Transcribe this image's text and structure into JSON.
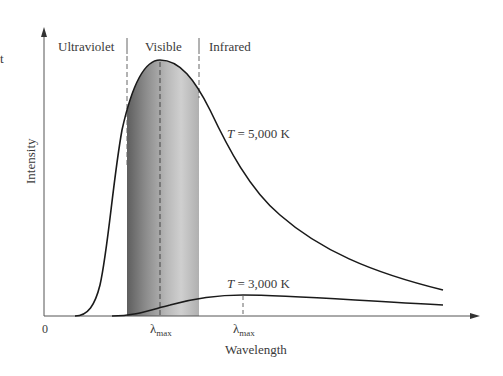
{
  "diagram": {
    "regions": [
      {
        "label": "Ultraviolet"
      },
      {
        "label": "Visible"
      },
      {
        "label": "Infrared"
      }
    ],
    "axes": {
      "x_label": "Wavelength",
      "y_label": "Intensity",
      "origin_label": "0"
    },
    "curves": [
      {
        "temperature_label": "T = 5,000 K",
        "T_italic": "T",
        "rest": " = 5,000 K",
        "lambda_max_label": "λ",
        "lambda_sub": "max"
      },
      {
        "temperature_label": "T = 3,000 K",
        "T_italic": "T",
        "rest": " = 3,000 K",
        "lambda_max_label": "λ",
        "lambda_sub": "max"
      }
    ],
    "edge_fragment": "t",
    "colors": {
      "curve": "#1a1a1a",
      "axis": "#555555",
      "visible_band_dark": "#6e6e6e",
      "visible_band_light": "#d2d2d2",
      "text": "#3a3a3a"
    }
  }
}
